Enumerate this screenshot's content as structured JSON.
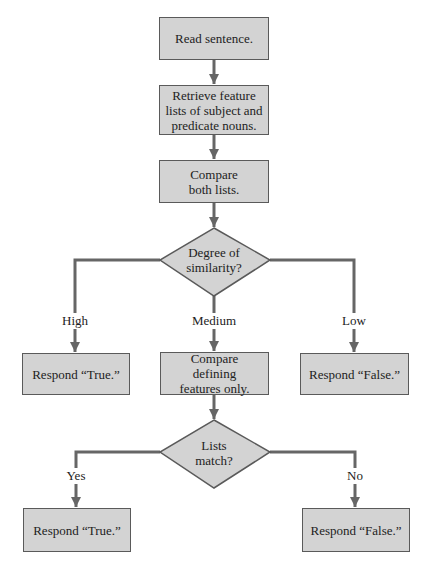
{
  "diagram": {
    "type": "flowchart",
    "colors": {
      "box_fill": "#d3d3d3",
      "box_border": "#5a5a5a",
      "line": "#666666",
      "background": "#ffffff"
    },
    "nodes": {
      "read": {
        "label": "Read sentence."
      },
      "retrieve": {
        "label": "Retrieve feature lists of subject and predicate nouns."
      },
      "compare_both": {
        "label": "Compare both lists."
      },
      "degree": {
        "label": "Degree of similarity?"
      },
      "respond_true_1": {
        "label": "Respond “True.”"
      },
      "compare_defining": {
        "label": "Compare defining features only."
      },
      "respond_false_1": {
        "label": "Respond “False.”"
      },
      "lists_match": {
        "label": "Lists match?"
      },
      "respond_true_2": {
        "label": "Respond “True.”"
      },
      "respond_false_2": {
        "label": "Respond “False.”"
      }
    },
    "edges": {
      "high": {
        "label": "High"
      },
      "medium": {
        "label": "Medium"
      },
      "low": {
        "label": "Low"
      },
      "yes": {
        "label": "Yes"
      },
      "no": {
        "label": "No"
      }
    }
  }
}
